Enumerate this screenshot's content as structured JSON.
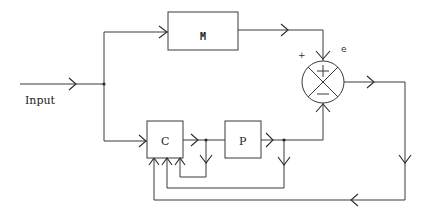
{
  "diagram": {
    "type": "block-diagram",
    "input_label": "Input",
    "blocks": {
      "m": {
        "label": "M"
      },
      "c": {
        "label": "C"
      },
      "p": {
        "label": "P"
      }
    },
    "summing_junction": {
      "plus_label": "+",
      "error_label": "e",
      "top_sign": "+",
      "bottom_sign": "−"
    }
  }
}
